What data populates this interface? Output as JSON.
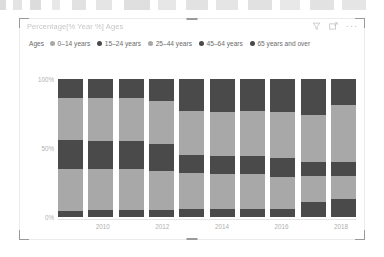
{
  "visual": {
    "title": "Percentage[% Year %] Ages",
    "toolbar": {
      "filter_icon": "filter-funnel-icon",
      "focus_icon": "focus-mode-icon",
      "more_label": "···"
    }
  },
  "legend": {
    "title": "Ages",
    "items": [
      {
        "label": "0–14 years",
        "color": "#a8a8a8"
      },
      {
        "label": "15–24 years",
        "color": "#4a4a4a"
      },
      {
        "label": "25–44 years",
        "color": "#a8a8a8"
      },
      {
        "label": "45–64 years",
        "color": "#4a4a4a"
      },
      {
        "label": "65 years and over",
        "color": "#4a4a4a"
      }
    ]
  },
  "chart_data": {
    "type": "bar",
    "stacked": true,
    "normalized": true,
    "title": "Percentage[% Year %] Ages",
    "xlabel": "",
    "ylabel": "",
    "ylim": [
      0,
      100
    ],
    "ytick_labels": [
      "100%",
      "50%",
      "0%"
    ],
    "ytick_values": [
      100,
      50,
      0
    ],
    "grid": false,
    "legend_position": "top",
    "categories": [
      "2009",
      "2010",
      "2011",
      "2012",
      "2013",
      "2014",
      "2015",
      "2016",
      "2017",
      "2018"
    ],
    "xtick_labels": [
      "2010",
      "2012",
      "2014",
      "2016",
      "2018"
    ],
    "series": [
      {
        "name": "65 years and over",
        "color": "#4a4a4a",
        "values": [
          14,
          14,
          14,
          16,
          23,
          24,
          23,
          24,
          26,
          19
        ]
      },
      {
        "name": "45–64 years",
        "color": "#a8a8a8",
        "values": [
          30,
          31,
          31,
          31,
          32,
          32,
          33,
          33,
          34,
          41
        ]
      },
      {
        "name": "25–44 years",
        "color": "#4a4a4a",
        "values": [
          21,
          20,
          20,
          20,
          13,
          13,
          13,
          14,
          10,
          10
        ]
      },
      {
        "name": "15–24 years",
        "color": "#a8a8a8",
        "values": [
          31,
          30,
          30,
          28,
          26,
          25,
          25,
          23,
          19,
          17
        ]
      },
      {
        "name": "0–14 years",
        "color": "#4a4a4a",
        "values": [
          4,
          5,
          5,
          5,
          6,
          6,
          6,
          6,
          11,
          13
        ]
      }
    ]
  }
}
